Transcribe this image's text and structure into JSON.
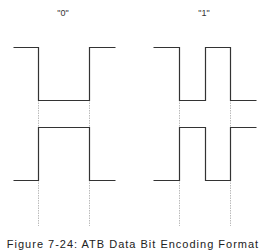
{
  "diagram": {
    "panels": [
      {
        "label": "\"0\"",
        "label_x": 63,
        "upper_wave": [
          [
            13,
            47
          ],
          [
            38,
            47
          ],
          [
            38,
            100
          ],
          [
            89,
            100
          ],
          [
            89,
            47
          ],
          [
            115,
            47
          ]
        ],
        "lower_wave": [
          [
            13,
            180
          ],
          [
            38,
            180
          ],
          [
            38,
            127
          ],
          [
            89,
            127
          ],
          [
            89,
            180
          ],
          [
            115,
            180
          ]
        ],
        "guides_x": [
          38,
          89
        ]
      },
      {
        "label": "\"1\"",
        "label_x": 204,
        "upper_wave": [
          [
            153,
            47
          ],
          [
            179,
            47
          ],
          [
            179,
            100
          ],
          [
            205,
            100
          ],
          [
            205,
            47
          ],
          [
            230,
            47
          ],
          [
            230,
            100
          ],
          [
            256,
            100
          ]
        ],
        "lower_wave": [
          [
            153,
            180
          ],
          [
            179,
            180
          ],
          [
            179,
            127
          ],
          [
            205,
            127
          ],
          [
            205,
            180
          ],
          [
            230,
            180
          ],
          [
            230,
            127
          ],
          [
            256,
            127
          ]
        ],
        "guides_x": [
          179,
          230
        ]
      }
    ],
    "guide_y_range": [
      100,
      226
    ],
    "colors": {
      "wave": "#333333",
      "guide": "#aaaaaa"
    },
    "caption": "Figure 7-24: ATB Data Bit Encoding Format"
  }
}
